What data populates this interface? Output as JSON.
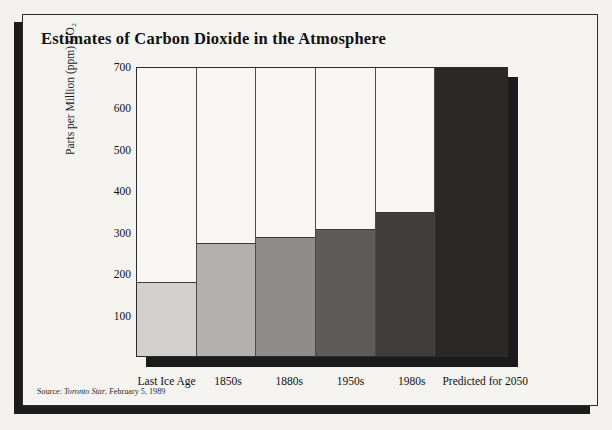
{
  "title": "Estimates of Carbon Dioxide in the Atmosphere",
  "source": {
    "prefix": "Source:",
    "publication": "Toronto Star",
    "date": ", February 5, 1989"
  },
  "chart_data": {
    "type": "bar",
    "title": "Estimates of Carbon Dioxide in the Atmosphere",
    "xlabel": "",
    "ylabel": "Parts per Million (ppm) CO₂",
    "ylim": [
      0,
      700
    ],
    "yticks": [
      100,
      200,
      300,
      400,
      500,
      600,
      700
    ],
    "grid": false,
    "legend": null,
    "categories": [
      "Last Ice Age",
      "1850s",
      "1880s",
      "1950s",
      "1980s",
      "Predicted for 2050"
    ],
    "values": [
      180,
      275,
      290,
      308,
      350,
      700
    ],
    "colors": [
      "#d2d0cd",
      "#b2b1ad",
      "#8d8c88",
      "#5d5c59",
      "#3f3e3b",
      "#2a2927"
    ],
    "series": [
      {
        "name": "Atmospheric CO2 (ppm)",
        "values": [
          180,
          275,
          290,
          308,
          350,
          700
        ]
      }
    ],
    "annotations": []
  },
  "axis": {
    "y_title": "Parts per Million (ppm) CO₂",
    "y_tick_labels": [
      "700",
      "600",
      "500",
      "400",
      "300",
      "200",
      "100"
    ]
  }
}
